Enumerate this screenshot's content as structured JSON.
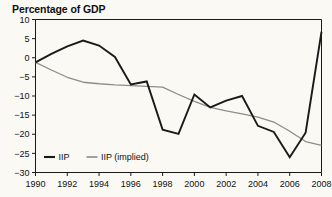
{
  "chart_data": {
    "type": "line",
    "title": "Percentage of GDP",
    "xlabel": "",
    "ylabel": "",
    "xlim": [
      1990,
      2008
    ],
    "ylim": [
      -30,
      10
    ],
    "grid": false,
    "legend_position": "bottom-left",
    "x": [
      1990,
      1991,
      1992,
      1993,
      1994,
      1995,
      1996,
      1997,
      1998,
      1999,
      2000,
      2001,
      2002,
      2003,
      2004,
      2005,
      2006,
      2007,
      2008
    ],
    "xticks": [
      "1990",
      "1992",
      "1994",
      "1996",
      "1998",
      "2000",
      "2002",
      "2004",
      "2006",
      "2008"
    ],
    "xtick_values": [
      1990,
      1992,
      1994,
      1996,
      1998,
      2000,
      2002,
      2004,
      2006,
      2008
    ],
    "yticks": [
      "10",
      "5",
      "0",
      "−5",
      "−10",
      "−15",
      "−20",
      "−25",
      "−30"
    ],
    "ytick_values": [
      10,
      5,
      0,
      -5,
      -10,
      -15,
      -20,
      -25,
      -30
    ],
    "series": [
      {
        "name": "IIP",
        "color": "#1a1a1a",
        "width": 1.9,
        "values": [
          -1.2,
          1.0,
          3.0,
          4.5,
          3.2,
          0.2,
          -7.0,
          -6.2,
          -18.8,
          -19.9,
          -9.6,
          -13.0,
          -11.2,
          -10.0,
          -17.8,
          -19.4,
          -26.0,
          -19.6,
          6.8
        ]
      },
      {
        "name": "IIP (implied)",
        "color": "#8d8d8a",
        "width": 1.3,
        "values": [
          -1.2,
          -3.2,
          -5.1,
          -6.4,
          -6.8,
          -7.1,
          -7.3,
          -7.5,
          -7.7,
          -9.6,
          -11.4,
          -13.0,
          -13.9,
          -14.7,
          -15.5,
          -16.8,
          -19.2,
          -21.9,
          -22.9
        ]
      }
    ],
    "legend": [
      {
        "label": "IIP",
        "color": "#1a1a1a",
        "width": 2.1
      },
      {
        "label": "IIP (implied)",
        "color": "#8d8d8a",
        "width": 1.6
      }
    ],
    "colors": {
      "background": "#fbf9f4",
      "axis": "#1a1a1a",
      "text": "#111111",
      "series_iip": "#1a1a1a",
      "series_iip_implied": "#8d8d8a"
    }
  }
}
